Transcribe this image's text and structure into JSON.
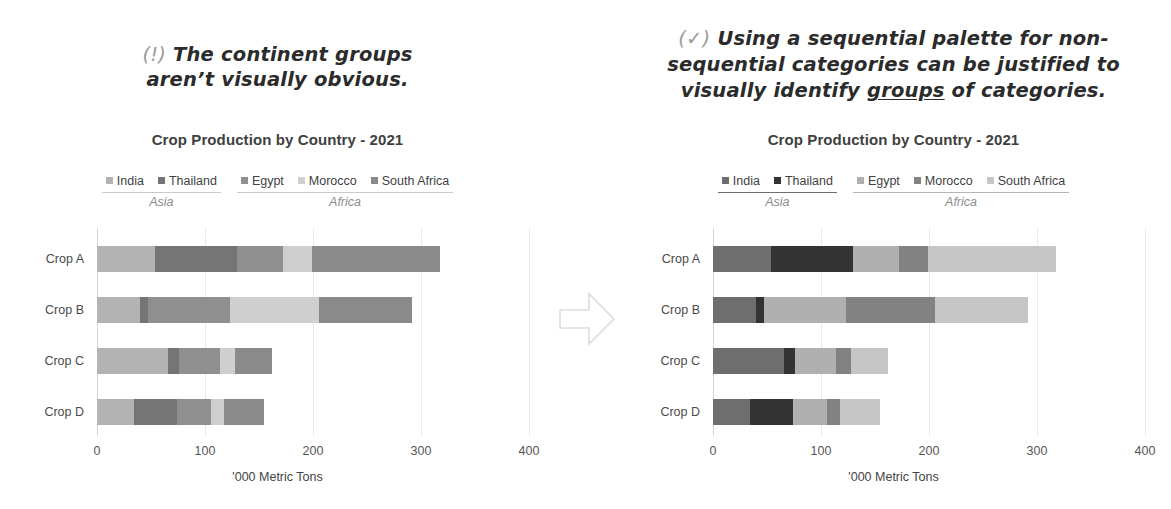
{
  "annotations": {
    "left": {
      "mark": "(!)",
      "line1": "The continent groups",
      "line2": "aren’t visually obvious."
    },
    "right": {
      "mark": "(✓)",
      "line1": "Using a sequential palette for non-",
      "line2": "sequential categories can be justified to",
      "line3_pre": "visually identify ",
      "line3_em": "groups",
      "line3_post": " of categories."
    }
  },
  "arrow": {
    "icon": "right-arrow-icon"
  },
  "chart_data": [
    {
      "id": "left-chart",
      "type": "bar",
      "orientation": "horizontal",
      "stacked": true,
      "title": "Crop Production by Country - 2021",
      "xlabel": "'000 Metric Tons",
      "ylabel": "",
      "xlim": [
        0,
        400
      ],
      "xticks": [
        0,
        100,
        200,
        300,
        400
      ],
      "grid": true,
      "legend_position": "top",
      "palette_name": "categorical-gray",
      "categories": [
        "Crop A",
        "Crop B",
        "Crop C",
        "Crop D"
      ],
      "series": [
        {
          "name": "India",
          "group": "Asia",
          "color": "#b3b3b3",
          "values": [
            54,
            40,
            66,
            34
          ]
        },
        {
          "name": "Thailand",
          "group": "Asia",
          "color": "#757575",
          "values": [
            76,
            7,
            10,
            40
          ]
        },
        {
          "name": "Egypt",
          "group": "Africa",
          "color": "#8f8f8f",
          "values": [
            42,
            76,
            38,
            32
          ]
        },
        {
          "name": "Morocco",
          "group": "Africa",
          "color": "#cfcfcf",
          "values": [
            27,
            83,
            14,
            12
          ]
        },
        {
          "name": "South Africa",
          "group": "Africa",
          "color": "#8a8a8a",
          "values": [
            119,
            86,
            34,
            37
          ]
        }
      ],
      "groups": [
        {
          "name": "Asia",
          "members": [
            "India",
            "Thailand"
          ],
          "rule_color": "#c9c9c9"
        },
        {
          "name": "Africa",
          "members": [
            "Egypt",
            "Morocco",
            "South Africa"
          ],
          "rule_color": "#c9c9c9"
        }
      ],
      "totals": [
        318,
        292,
        162,
        155
      ]
    },
    {
      "id": "right-chart",
      "type": "bar",
      "orientation": "horizontal",
      "stacked": true,
      "title": "Crop Production by Country - 2021",
      "xlabel": "'000 Metric Tons",
      "ylabel": "",
      "xlim": [
        0,
        400
      ],
      "xticks": [
        0,
        100,
        200,
        300,
        400
      ],
      "grid": true,
      "legend_position": "top",
      "palette_name": "sequential-gray",
      "categories": [
        "Crop A",
        "Crop B",
        "Crop C",
        "Crop D"
      ],
      "series": [
        {
          "name": "India",
          "group": "Asia",
          "color": "#6e6e6e",
          "values": [
            54,
            40,
            66,
            34
          ]
        },
        {
          "name": "Thailand",
          "group": "Asia",
          "color": "#333333",
          "values": [
            76,
            7,
            10,
            40
          ]
        },
        {
          "name": "Egypt",
          "group": "Africa",
          "color": "#b0b0b0",
          "values": [
            42,
            76,
            38,
            32
          ]
        },
        {
          "name": "Morocco",
          "group": "Africa",
          "color": "#828282",
          "values": [
            27,
            83,
            14,
            12
          ]
        },
        {
          "name": "South Africa",
          "group": "Africa",
          "color": "#c6c6c6",
          "values": [
            119,
            86,
            34,
            37
          ]
        }
      ],
      "groups": [
        {
          "name": "Asia",
          "members": [
            "India",
            "Thailand"
          ],
          "rule_color": "#6e6e6e"
        },
        {
          "name": "Africa",
          "members": [
            "Egypt",
            "Morocco",
            "South Africa"
          ],
          "rule_color": "#b5b5b5"
        }
      ],
      "totals": [
        318,
        292,
        162,
        155
      ]
    }
  ]
}
